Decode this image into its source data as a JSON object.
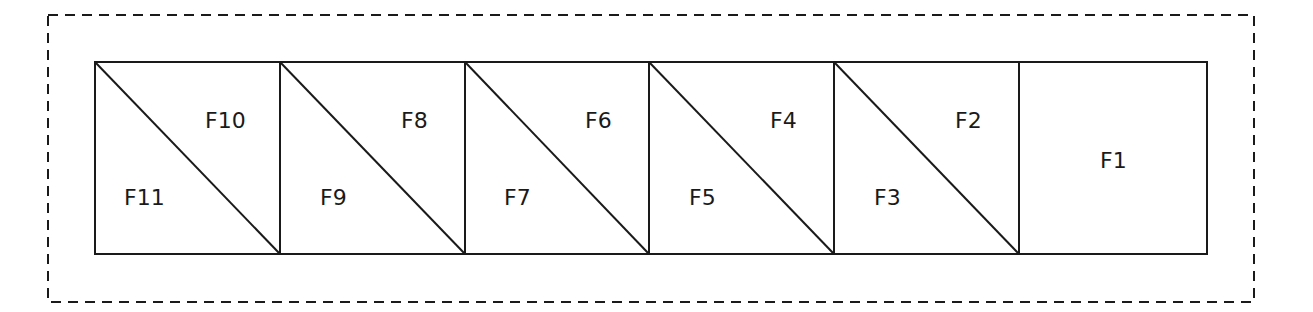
{
  "diagram": {
    "boundary": {
      "style": "dashed",
      "color": "#1a1a1a"
    },
    "cells": [
      {
        "index": 0,
        "upper_label": "F10",
        "lower_label": "F11",
        "split": true
      },
      {
        "index": 1,
        "upper_label": "F8",
        "lower_label": "F9",
        "split": true
      },
      {
        "index": 2,
        "upper_label": "F6",
        "lower_label": "F7",
        "split": true
      },
      {
        "index": 3,
        "upper_label": "F4",
        "lower_label": "F5",
        "split": true
      },
      {
        "index": 4,
        "upper_label": "F2",
        "lower_label": "F3",
        "split": true
      },
      {
        "index": 5,
        "label": "F1",
        "split": false
      }
    ]
  }
}
